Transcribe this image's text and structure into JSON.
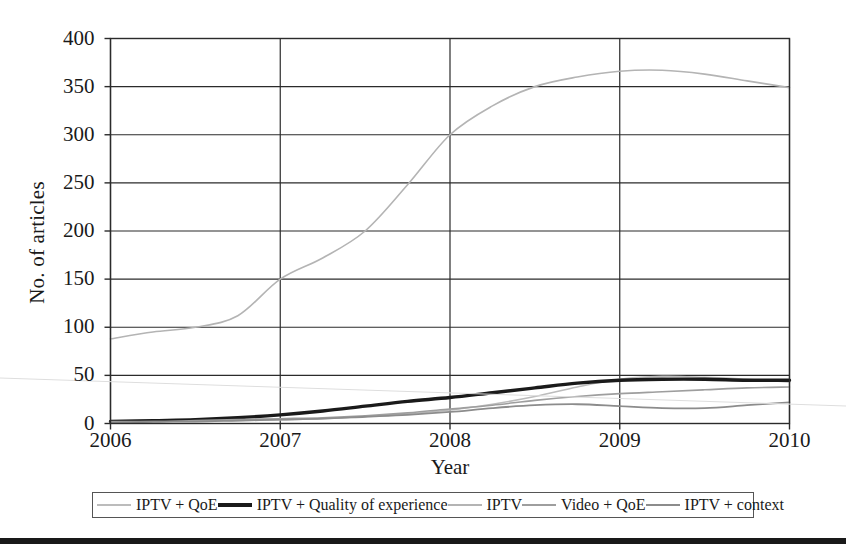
{
  "chart_data": {
    "type": "line",
    "title": "",
    "xlabel": "Year",
    "ylabel": "No. of articles",
    "xlim": [
      2006,
      2010
    ],
    "ylim": [
      0,
      400
    ],
    "yticks": [
      0,
      50,
      100,
      150,
      200,
      250,
      300,
      350,
      400
    ],
    "xticks": [
      2006,
      2007,
      2008,
      2009,
      2010
    ],
    "xtick_labels": [
      "2006",
      "2007",
      "2008",
      "2009",
      "2010"
    ],
    "ytick_labels": [
      "0",
      "50",
      "100",
      "150",
      "200",
      "250",
      "300",
      "350",
      "400"
    ],
    "grid": true,
    "grid_axis": "both",
    "legend_position": "below-plot",
    "x": [
      2006,
      2006.25,
      2006.5,
      2006.75,
      2007,
      2007.25,
      2007.5,
      2007.75,
      2008,
      2008.25,
      2008.5,
      2008.75,
      2009,
      2009.25,
      2009.5,
      2009.75,
      2010
    ],
    "series": [
      {
        "name": "IPTV + QoE",
        "color": "#bcbcbc",
        "width": 1.6,
        "values": [
          2,
          2,
          3,
          3,
          4,
          5,
          7,
          10,
          14,
          20,
          28,
          38,
          46,
          49,
          48,
          46,
          43
        ]
      },
      {
        "name": "IPTV + Quality of experience",
        "color": "#1a1a1a",
        "width": 3.4,
        "values": [
          2,
          3,
          4,
          6,
          9,
          13,
          18,
          23,
          27,
          32,
          37,
          42,
          45,
          46,
          46,
          45,
          45
        ]
      },
      {
        "name": "IPTV",
        "color": "#b4b4b4",
        "width": 1.6,
        "values": [
          88,
          95,
          100,
          112,
          150,
          172,
          200,
          248,
          300,
          330,
          350,
          360,
          366,
          367,
          363,
          356,
          349
        ]
      },
      {
        "name": "Video + QoE",
        "color": "#9e9e9e",
        "width": 1.6,
        "values": [
          2,
          2,
          3,
          4,
          5,
          6,
          8,
          11,
          15,
          19,
          24,
          28,
          31,
          33,
          35,
          37,
          38
        ]
      },
      {
        "name": "IPTV + context",
        "color": "#8c8c8c",
        "width": 1.8,
        "values": [
          1,
          2,
          2,
          3,
          4,
          5,
          7,
          9,
          12,
          16,
          19,
          20,
          18,
          16,
          16,
          19,
          22
        ]
      }
    ]
  },
  "axes": {
    "y_title": "No. of articles",
    "x_title": "Year"
  },
  "legend": {
    "items": [
      {
        "label": "IPTV + QoE",
        "color": "#bcbcbc",
        "thickness": "2px"
      },
      {
        "label": "IPTV + Quality of experience",
        "color": "#1a1a1a",
        "thickness": "4px"
      },
      {
        "label": "IPTV",
        "color": "#b4b4b4",
        "thickness": "2px"
      },
      {
        "label": "Video + QoE",
        "color": "#9e9e9e",
        "thickness": "2px"
      },
      {
        "label": "IPTV + context",
        "color": "#8c8c8c",
        "thickness": "2px"
      }
    ]
  },
  "style": {
    "axis_color": "#2b2b2b",
    "grid_color": "#2b2b2b",
    "background": "#ffffff",
    "rule_color": "#191919"
  }
}
